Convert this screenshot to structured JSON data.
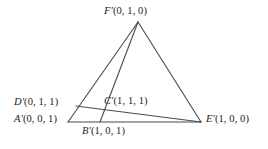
{
  "figure": {
    "name": "labelled-triangle-diagram",
    "stroke_color": "#4a4a4a",
    "text_color": "#1a1a1a",
    "background_color": "#ffffff"
  },
  "vertices": {
    "F": {
      "point": "F′",
      "coords": "(0, 1, 0)"
    },
    "D": {
      "point": "D′",
      "coords": "(0, 1, 1)"
    },
    "A": {
      "point": "A′",
      "coords": "(0, 0, 1)"
    },
    "C": {
      "point": "C′",
      "coords": "(1, 1, 1)"
    },
    "B": {
      "point": "B′",
      "coords": "(1, 0, 1)"
    },
    "E": {
      "point": "E′",
      "coords": "(1, 0, 0)"
    }
  },
  "geometry": {
    "points": {
      "F": [
        138,
        22
      ],
      "D": [
        76,
        106
      ],
      "A": [
        68,
        122
      ],
      "C": [
        98,
        112
      ],
      "B": [
        100,
        122
      ],
      "E": [
        201,
        122
      ]
    },
    "segments": [
      {
        "name": "segment-F-A",
        "from": "F",
        "to": "A"
      },
      {
        "name": "segment-F-B",
        "from": "F",
        "to": "B"
      },
      {
        "name": "segment-F-E",
        "from": "F",
        "to": "E"
      },
      {
        "name": "segment-A-E",
        "from": "A",
        "to": "E"
      },
      {
        "name": "segment-D-E",
        "from": "D",
        "to": "E"
      }
    ]
  }
}
